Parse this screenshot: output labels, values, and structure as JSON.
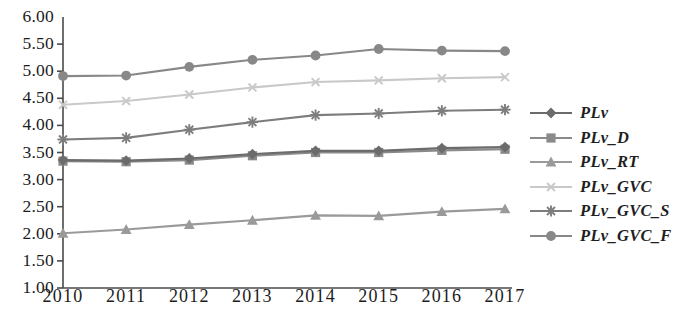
{
  "chart_data": {
    "type": "line",
    "title": "",
    "xlabel": "",
    "ylabel": "",
    "categories": [
      "2010",
      "2011",
      "2012",
      "2013",
      "2014",
      "2015",
      "2016",
      "2017"
    ],
    "ylim": [
      1.0,
      6.0
    ],
    "ytick_step": 0.5,
    "yticks": [
      "1.00",
      "1.50",
      "2.00",
      "2.50",
      "3.00",
      "3.50",
      "4.00",
      "4.50",
      "5.00",
      "5.50",
      "6.00"
    ],
    "grid": false,
    "legend_position": "right",
    "series": [
      {
        "name": "PLv",
        "marker": "diamond",
        "color": "#6b6b6b",
        "values": [
          3.36,
          3.35,
          3.39,
          3.47,
          3.53,
          3.53,
          3.58,
          3.6
        ]
      },
      {
        "name": "PLv_D",
        "marker": "square",
        "color": "#8a8a8a",
        "values": [
          3.34,
          3.33,
          3.36,
          3.44,
          3.5,
          3.5,
          3.54,
          3.56
        ]
      },
      {
        "name": "PLv_RT",
        "marker": "triangle",
        "color": "#9a9a9a",
        "values": [
          2.01,
          2.08,
          2.17,
          2.25,
          2.34,
          2.33,
          2.41,
          2.46
        ]
      },
      {
        "name": "PLv_GVC",
        "marker": "x",
        "color": "#c9c9c9",
        "values": [
          4.38,
          4.45,
          4.57,
          4.7,
          4.8,
          4.83,
          4.87,
          4.89
        ]
      },
      {
        "name": "PLv_GVC_S",
        "marker": "asterisk",
        "color": "#7d7d7d",
        "values": [
          3.74,
          3.77,
          3.92,
          4.06,
          4.19,
          4.22,
          4.27,
          4.29
        ]
      },
      {
        "name": "PLv_GVC_F",
        "marker": "circle",
        "color": "#888888",
        "values": [
          4.91,
          4.92,
          5.08,
          5.21,
          5.29,
          5.41,
          5.38,
          5.37
        ]
      }
    ]
  }
}
